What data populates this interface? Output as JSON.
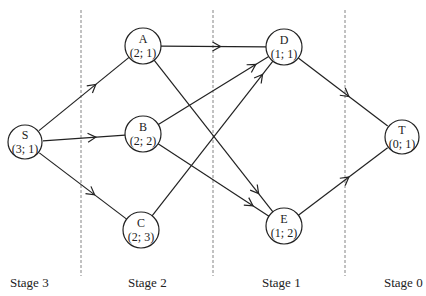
{
  "diagram": {
    "type": "staged-network",
    "colors": {
      "stroke": "#222222",
      "dashed": "#777777",
      "background": "#ffffff"
    },
    "nodes": [
      {
        "id": "S",
        "name": "S",
        "value": "(3; 1)",
        "x": 25,
        "y": 142
      },
      {
        "id": "A",
        "name": "A",
        "value": "(2; 1)",
        "x": 143,
        "y": 46
      },
      {
        "id": "B",
        "name": "B",
        "value": "(2; 2)",
        "x": 143,
        "y": 134
      },
      {
        "id": "C",
        "name": "C",
        "value": "(2; 3)",
        "x": 141,
        "y": 230
      },
      {
        "id": "D",
        "name": "D",
        "value": "(1; 1)",
        "x": 284,
        "y": 47
      },
      {
        "id": "E",
        "name": "E",
        "value": "(1; 2)",
        "x": 284,
        "y": 226
      },
      {
        "id": "T",
        "name": "T",
        "value": "(0; 1)",
        "x": 402,
        "y": 137
      }
    ],
    "edges": [
      {
        "from": "S",
        "to": "A",
        "arrow_at": 0.6
      },
      {
        "from": "S",
        "to": "B",
        "arrow_at": 0.6
      },
      {
        "from": "S",
        "to": "C",
        "arrow_at": 0.6
      },
      {
        "from": "A",
        "to": "D",
        "arrow_at": 0.55
      },
      {
        "from": "A",
        "to": "E",
        "arrow_at": 0.82
      },
      {
        "from": "B",
        "to": "D",
        "arrow_at": 0.8
      },
      {
        "from": "B",
        "to": "E",
        "arrow_at": 0.78
      },
      {
        "from": "C",
        "to": "D",
        "arrow_at": 0.85
      },
      {
        "from": "D",
        "to": "T",
        "arrow_at": 0.55
      },
      {
        "from": "E",
        "to": "T",
        "arrow_at": 0.55
      }
    ],
    "dividers": [
      81,
      213,
      345
    ],
    "stages": [
      {
        "label": "Stage 3",
        "x": 10
      },
      {
        "label": "Stage 2",
        "x": 128
      },
      {
        "label": "Stage 1",
        "x": 262
      },
      {
        "label": "Stage 0",
        "x": 384
      }
    ]
  },
  "node_texts": {
    "S": {
      "name": "S",
      "value": "(3; 1)"
    },
    "A": {
      "name": "A",
      "value": "(2; 1)"
    },
    "B": {
      "name": "B",
      "value": "(2; 2)"
    },
    "C": {
      "name": "C",
      "value": "(2; 3)"
    },
    "D": {
      "name": "D",
      "value": "(1; 1)"
    },
    "E": {
      "name": "E",
      "value": "(1; 2)"
    },
    "T": {
      "name": "T",
      "value": "(0; 1)"
    }
  },
  "stage_labels": [
    "Stage 3",
    "Stage 2",
    "Stage 1",
    "Stage 0"
  ]
}
